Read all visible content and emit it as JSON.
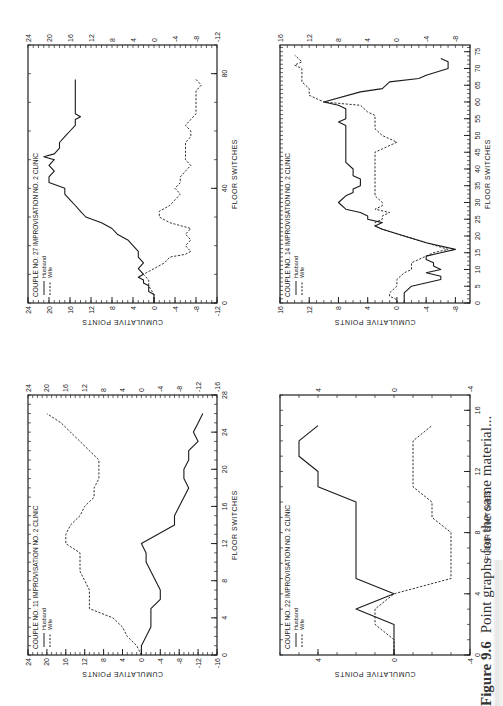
{
  "page": {
    "orientation": "rotated -90deg (landscape figure on portrait page)",
    "caption_label": "Figure 9.6",
    "caption_text": "Point graphs for the same material..."
  },
  "common": {
    "xlabel": "FLOOR SWITCHES",
    "ylabel": "CUMULATIVE POINTS",
    "legend": [
      {
        "name": "Husband",
        "style": "solid"
      },
      {
        "name": "Wife",
        "style": "dashed"
      }
    ],
    "title_mid": "IMPROVISATION  NO. 2",
    "title_right": "CLINIC"
  },
  "chart_data": [
    {
      "type": "line",
      "id": "couple27",
      "position": "top-left",
      "title": "COUPLE  NO. 27",
      "subtitle": "IMPROVISATION NO. 2   CLINIC",
      "xlabel": "FLOOR SWITCHES",
      "ylabel": "CUMULATIVE POINTS",
      "xlim": [
        0,
        90
      ],
      "ylim": [
        -12,
        24
      ],
      "xticks": [
        0,
        40,
        80
      ],
      "yticks": [
        -12,
        -8,
        -4,
        0,
        4,
        8,
        12,
        16,
        20,
        24
      ],
      "legend": [
        "Husband",
        "Wife"
      ],
      "series": [
        {
          "name": "Husband",
          "style": "solid",
          "x": [
            0,
            3,
            4,
            6,
            7,
            8,
            9,
            10,
            12,
            14,
            16,
            18,
            20,
            22,
            24,
            26,
            28,
            30,
            32,
            34,
            36,
            38,
            40,
            42,
            44,
            46,
            48,
            50,
            51,
            52,
            54,
            56,
            58,
            60,
            62,
            64,
            65,
            66,
            68,
            70,
            72,
            74,
            76,
            78
          ],
          "y": [
            0,
            0,
            1,
            1,
            2,
            2,
            3,
            2,
            3,
            2,
            3,
            3,
            4,
            5,
            7,
            8,
            10,
            13,
            14,
            15,
            16,
            17,
            17,
            20,
            20,
            19,
            20,
            19,
            21,
            19,
            18,
            18,
            17,
            16,
            15,
            15,
            14,
            15,
            15,
            15,
            15,
            15,
            15,
            15
          ]
        },
        {
          "name": "Wife",
          "style": "dashed",
          "x": [
            0,
            3,
            6,
            8,
            10,
            12,
            14,
            16,
            17,
            18,
            20,
            22,
            24,
            26,
            28,
            30,
            32,
            34,
            36,
            38,
            40,
            42,
            44,
            46,
            48,
            50,
            52,
            54,
            56,
            58,
            60,
            62,
            64,
            66,
            68,
            70,
            72,
            74,
            76,
            78
          ],
          "y": [
            0,
            0,
            1,
            1,
            2,
            0,
            -2,
            -3,
            -6,
            -7,
            -6,
            -7,
            -6,
            -7,
            -3,
            -1,
            -1,
            -3,
            -4,
            -5,
            -4,
            -5,
            -5,
            -6,
            -7,
            -6,
            -6,
            -6,
            -6,
            -7,
            -7,
            -6,
            -7,
            -8,
            -8,
            -8,
            -8,
            -8,
            -9,
            -8
          ]
        }
      ]
    },
    {
      "type": "line",
      "id": "couple14",
      "position": "top-right",
      "title": "COUPLE  NO. 14",
      "subtitle": "IMPROVISATION NO. 2   CLINIC",
      "xlabel": "FLOOR SWITCHES",
      "ylabel": "CUMULATIVE POINTS",
      "xlim": [
        0,
        77
      ],
      "ylim": [
        -10,
        16
      ],
      "xticks": [
        0,
        5,
        10,
        15,
        20,
        25,
        30,
        35,
        40,
        45,
        50,
        55,
        60,
        65,
        70,
        75
      ],
      "yticks": [
        -8,
        -4,
        0,
        4,
        8,
        12,
        16
      ],
      "legend": [
        "Husband",
        "Wife"
      ],
      "series": [
        {
          "name": "Husband",
          "style": "solid",
          "x": [
            0,
            3,
            5,
            7,
            8,
            9,
            10,
            11,
            12,
            13,
            14,
            15,
            16,
            18,
            20,
            22,
            23,
            24,
            25,
            26,
            27,
            28,
            30,
            32,
            33,
            34,
            35,
            37,
            38,
            40,
            42,
            50,
            53,
            54,
            55,
            56,
            58,
            59,
            60,
            63,
            64,
            66,
            67,
            68,
            70,
            72,
            73
          ],
          "y": [
            -1,
            -1,
            -2,
            -6,
            -6,
            -4,
            -6,
            -5,
            -5,
            -4,
            -4,
            -6,
            -8,
            -4,
            -1,
            2,
            3,
            2,
            4,
            4,
            5,
            7,
            8,
            7,
            6,
            6,
            5,
            5,
            6,
            6,
            7,
            7,
            7,
            8,
            7,
            7,
            7,
            8,
            10,
            5,
            2,
            1,
            -3,
            -4,
            -7,
            -7,
            -6
          ]
        },
        {
          "name": "Wife",
          "style": "dashed",
          "x": [
            0,
            1,
            2,
            3,
            5,
            7,
            9,
            10,
            11,
            12,
            13,
            14,
            15,
            16,
            18,
            20,
            22,
            23,
            24,
            25,
            26,
            27,
            28,
            29,
            30,
            32,
            45,
            46,
            48,
            50,
            52,
            56,
            57,
            59,
            60,
            62,
            64,
            66,
            68,
            70,
            71,
            72,
            74
          ],
          "y": [
            0,
            0,
            1,
            1,
            0,
            0,
            -1,
            -2,
            -2,
            -2,
            -3,
            -4,
            -5,
            -7,
            -4,
            -1,
            2,
            3,
            3,
            2,
            2,
            1,
            3,
            2,
            2,
            3,
            3,
            2,
            0,
            2,
            3,
            3,
            4,
            5,
            10,
            12,
            12,
            13,
            13,
            13,
            14,
            13,
            14
          ]
        }
      ]
    },
    {
      "type": "line",
      "id": "couple11",
      "position": "bottom-left",
      "title": "COUPLE  NO. 11",
      "subtitle": "IMPROVISATION NO. 2   CLINIC",
      "xlabel": "FLOOR SWITCHES",
      "ylabel": "CUMULATIVE POINTS",
      "xlim": [
        0,
        28
      ],
      "ylim": [
        -16,
        24
      ],
      "xticks": [
        0,
        4,
        8,
        12,
        16,
        20,
        24,
        28
      ],
      "yticks": [
        -16,
        -12,
        -8,
        -4,
        0,
        4,
        8,
        12,
        16,
        20,
        24
      ],
      "legend": [
        "Husband",
        "Wife"
      ],
      "series": [
        {
          "name": "Husband",
          "style": "solid",
          "x": [
            0,
            1,
            3,
            5,
            6,
            7,
            8,
            10,
            11,
            12,
            14,
            15,
            16,
            18,
            19,
            20,
            21,
            22,
            23,
            24,
            25,
            26
          ],
          "y": [
            0,
            0,
            -2,
            -2,
            -4,
            -4,
            -3,
            -1,
            -1,
            0,
            -7,
            -7,
            -8,
            -10,
            -9,
            -9,
            -10,
            -10,
            -12,
            -11,
            -12,
            -13
          ]
        },
        {
          "name": "Wife",
          "style": "dashed",
          "x": [
            0,
            1,
            2,
            3,
            4,
            5,
            6,
            7,
            8,
            9,
            11,
            12,
            13,
            14,
            15,
            16,
            17,
            18,
            19,
            20,
            21,
            22,
            23,
            24,
            25,
            26
          ],
          "y": [
            0,
            1,
            3,
            4,
            6,
            11,
            11,
            11,
            12,
            13,
            13,
            16,
            16,
            15,
            13,
            12,
            10,
            10,
            9,
            9,
            9,
            11,
            13,
            15,
            17,
            20
          ]
        }
      ]
    },
    {
      "type": "line",
      "id": "couple22",
      "position": "bottom-right",
      "title": "COUPLE  NO. 22",
      "subtitle": "IMPROVISATION NO. 2   CLINIC",
      "xlabel": "FLOOR SWITCHES",
      "ylabel": "CUMULATIVE POINTS",
      "xlim": [
        0,
        17
      ],
      "ylim": [
        -4,
        6
      ],
      "xticks": [
        0,
        4,
        8,
        12,
        16
      ],
      "yticks": [
        -4,
        0,
        4
      ],
      "legend": [
        "Husband",
        "Wife"
      ],
      "series": [
        {
          "name": "Husband",
          "style": "solid",
          "x": [
            0,
            2,
            3,
            4,
            5,
            10,
            11,
            12,
            13,
            14,
            15
          ],
          "y": [
            0,
            0,
            2,
            0,
            2,
            2,
            4,
            4,
            5,
            5,
            4
          ]
        },
        {
          "name": "Wife",
          "style": "dashed",
          "x": [
            0,
            1,
            2,
            3,
            4,
            5,
            8,
            9,
            10,
            11,
            14,
            15
          ],
          "y": [
            0,
            0,
            1,
            1,
            0,
            -3,
            -3,
            -2,
            -2,
            -1,
            -1,
            -2
          ]
        }
      ]
    }
  ]
}
